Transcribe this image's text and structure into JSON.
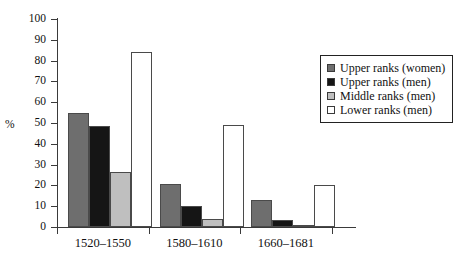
{
  "chart_data": {
    "type": "bar",
    "title": "",
    "xlabel": "",
    "ylabel": "%",
    "ylim": [
      0,
      100
    ],
    "ytick_step": 10,
    "yticks": [
      100,
      90,
      80,
      70,
      60,
      50,
      40,
      30,
      20,
      10,
      0
    ],
    "grid": false,
    "legend_position": "right",
    "categories": [
      "1520–1550",
      "1580–1610",
      "1660–1681"
    ],
    "series": [
      {
        "name": "Upper ranks (women)",
        "color": "#6e6e6e",
        "values": [
          55,
          20.5,
          13
        ]
      },
      {
        "name": "Upper ranks (men)",
        "color": "#151515",
        "values": [
          48.5,
          10,
          3.5
        ]
      },
      {
        "name": "Middle ranks (men)",
        "color": "#bfbfbf",
        "values": [
          26.5,
          4,
          1
        ]
      },
      {
        "name": "Lower ranks (men)",
        "color": "#ffffff",
        "values": [
          84,
          49,
          20
        ]
      }
    ]
  },
  "legend": {
    "items": [
      {
        "label": "Upper ranks (women)",
        "swatch": "#6e6e6e"
      },
      {
        "label": "Upper ranks (men)",
        "swatch": "#151515"
      },
      {
        "label": "Middle ranks (men)",
        "swatch": "#bfbfbf"
      },
      {
        "label": "Lower ranks (men)",
        "swatch": "#ffffff"
      }
    ]
  }
}
